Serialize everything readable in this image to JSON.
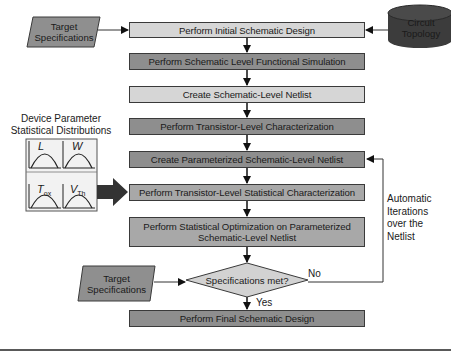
{
  "diagram": {
    "inputs": {
      "target_specs_top": "Target\nSpecifications",
      "target_specs_top_line1": "Target",
      "target_specs_top_line2": "Specifications",
      "circuit_topology_line1": "Circuit",
      "circuit_topology_line2": "Topology",
      "target_specs_bottom_line1": "Target",
      "target_specs_bottom_line2": "Specifications"
    },
    "device_params": {
      "title_line1": "Device Parameter",
      "title_line2": "Statistical Distributions",
      "distributions": [
        {
          "name": "L",
          "sub": ""
        },
        {
          "name": "W",
          "sub": ""
        },
        {
          "name": "T",
          "sub": "ox"
        },
        {
          "name": "V",
          "sub": "Th"
        }
      ]
    },
    "steps": [
      {
        "label": "Perform Initial Schematic Design",
        "shade": "light"
      },
      {
        "label": "Perform Schematic Level Functional Simulation",
        "shade": "dark"
      },
      {
        "label": "Create Schematic-Level Netlist",
        "shade": "light"
      },
      {
        "label": "Perform Transistor-Level Characterization",
        "shade": "dark"
      },
      {
        "label": "Create Parameterized Schematic-Level Netlist",
        "shade": "dark"
      },
      {
        "label": "Perform Transistor-Level Statistical Characterization",
        "shade": "mid"
      },
      {
        "label_line1": "Perform Statistical Optimization on Parameterized",
        "label_line2": "Schematic-Level Netlist",
        "shade": "mid"
      },
      {
        "label": "Perform Final Schematic Design",
        "shade": "dark"
      }
    ],
    "decision": {
      "label": "Specifications met?",
      "yes": "Yes",
      "no": "No"
    },
    "loop_note": {
      "line1": "Automatic",
      "line2": "Iterations",
      "line3": "over the",
      "line4": "Netlist"
    },
    "colors": {
      "light_box": "#d6d6d6",
      "mid_box": "#a8a8a8",
      "dark_box": "#8e8e8e",
      "parallelogram": "#8f8f8f",
      "cylinder": "#3c3c3c",
      "arrow": "#111111",
      "big_arrow": "#333333"
    }
  }
}
